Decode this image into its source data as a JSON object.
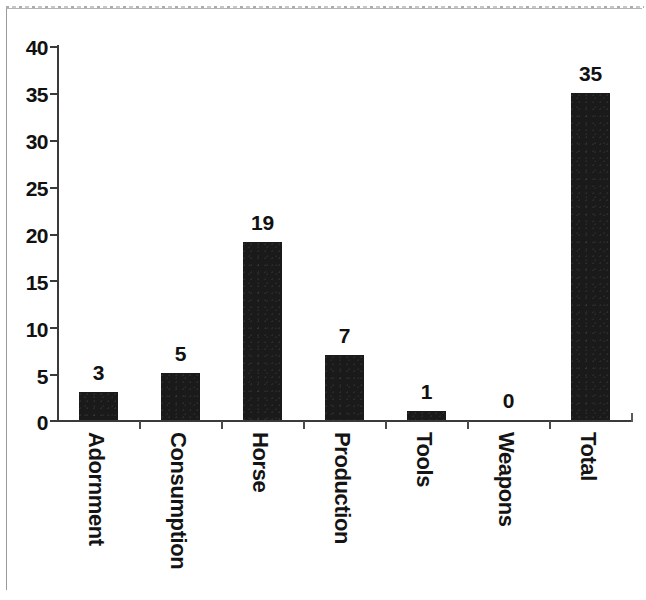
{
  "chart_data": {
    "type": "bar",
    "title": "",
    "subtitle": "",
    "xlabel": "",
    "ylabel": "",
    "categories": [
      "Adornment",
      "Consumption",
      "Horse",
      "Production",
      "Tools",
      "Weapons",
      "Total"
    ],
    "values": [
      3,
      5,
      19,
      7,
      1,
      0,
      35
    ],
    "value_labels": [
      "3",
      "5",
      "19",
      "7",
      "1",
      "0",
      "35"
    ],
    "ylim": [
      0,
      40
    ],
    "ytick_values": [
      40,
      35,
      30,
      25,
      20,
      15,
      10,
      5,
      0
    ],
    "ytick_labels": [
      "40",
      "35",
      "30",
      "25",
      "20",
      "15",
      "10",
      "5",
      "0"
    ],
    "grid": false,
    "legend": null,
    "legend_position": "none",
    "bar_color": "#1a1a1a",
    "axis_color": "#3a3a3a",
    "background_color": "#ffffff",
    "value_labels_shown": true,
    "category_label_rotation": 90,
    "series": [
      {
        "name": "count",
        "values": [
          3,
          5,
          19,
          7,
          1,
          0,
          35
        ]
      }
    ]
  },
  "figure": {
    "border_color": "#9a9a9a",
    "page_background": "#ffffff"
  }
}
